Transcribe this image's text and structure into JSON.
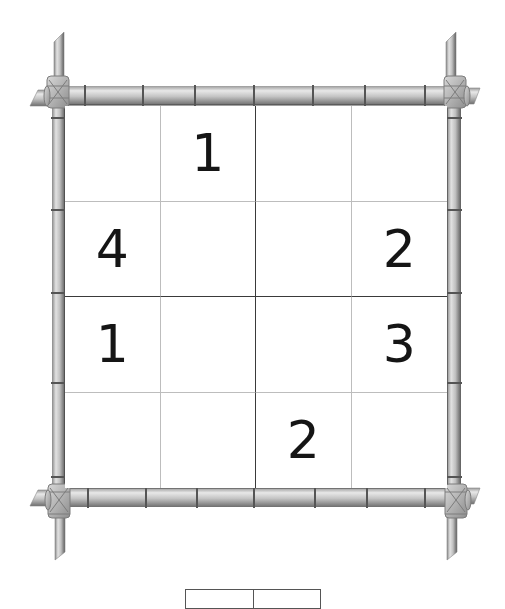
{
  "puzzle": {
    "size": 4,
    "box_size": 2,
    "grid": [
      [
        "",
        "1",
        "",
        ""
      ],
      [
        "4",
        "",
        "",
        "2"
      ],
      [
        "1",
        "",
        "",
        "3"
      ],
      [
        "",
        "",
        "2",
        ""
      ]
    ]
  },
  "colors": {
    "digit": "#151515",
    "thin_line": "#bdbdbd",
    "thick_line": "#3a3a3a",
    "bamboo_light": "#e6e6e6",
    "bamboo_dark": "#7a7a7a"
  },
  "frame": {
    "style": "bamboo",
    "corner_decoration": "rope-knot"
  },
  "bottom_panel": {
    "segments": [
      "",
      ""
    ]
  }
}
